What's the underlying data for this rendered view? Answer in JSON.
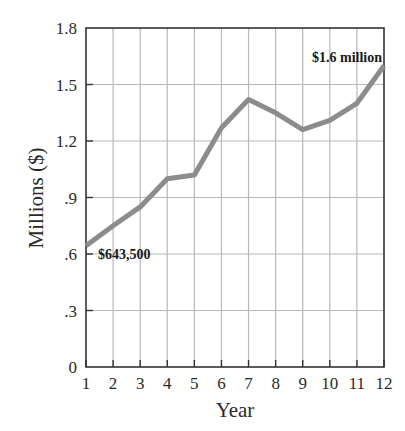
{
  "chart_data": {
    "type": "line",
    "title": "",
    "xlabel": "Year",
    "ylabel": "Millions ($)",
    "x": [
      1,
      2,
      3,
      4,
      5,
      6,
      7,
      8,
      9,
      10,
      11,
      12
    ],
    "series": [
      {
        "name": "Value",
        "values": [
          0.6435,
          0.75,
          0.85,
          1.0,
          1.02,
          1.27,
          1.42,
          1.35,
          1.26,
          1.31,
          1.4,
          1.6
        ]
      }
    ],
    "xlim": [
      1,
      12
    ],
    "ylim": [
      0,
      1.8
    ],
    "xticks": [
      "1",
      "2",
      "3",
      "4",
      "5",
      "6",
      "7",
      "8",
      "9",
      "10",
      "11",
      "12"
    ],
    "yticks": [
      {
        "value": 0,
        "label": "0"
      },
      {
        "value": 0.3,
        "label": ".3"
      },
      {
        "value": 0.6,
        "label": ".6"
      },
      {
        "value": 0.9,
        "label": ".9"
      },
      {
        "value": 1.2,
        "label": "1.2"
      },
      {
        "value": 1.5,
        "label": "1.5"
      },
      {
        "value": 1.8,
        "label": "1.8"
      }
    ],
    "grid": true,
    "legend": "none",
    "annotations": [
      {
        "text": "$643,500",
        "x": 1,
        "y": 0.6435
      },
      {
        "text": "$1.6 million",
        "x": 12,
        "y": 1.6
      }
    ]
  },
  "colors": {
    "line": "#8c8c8c",
    "grid": "#b9b9b9",
    "axis": "#333333",
    "text": "#2a2a2a"
  }
}
